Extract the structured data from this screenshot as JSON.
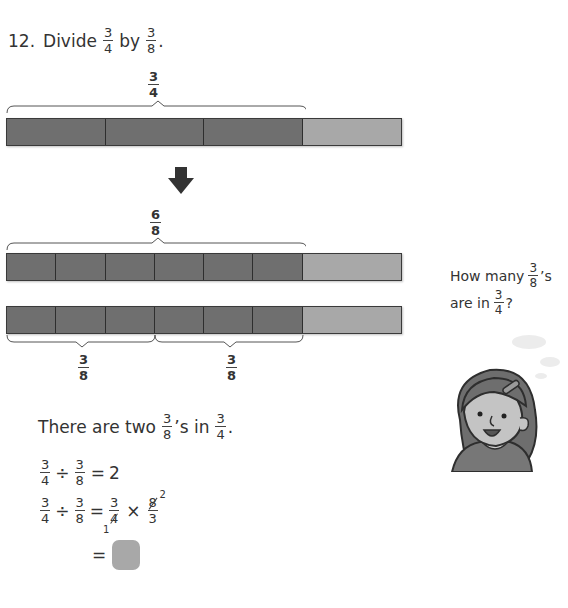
{
  "question": {
    "number": "12.",
    "verb": "Divide",
    "dividend": {
      "n": "3",
      "d": "4"
    },
    "joiner": "by",
    "divisor": {
      "n": "3",
      "d": "8"
    },
    "end": "."
  },
  "diagram": {
    "top_label": {
      "n": "3",
      "d": "4"
    },
    "middle_label": {
      "n": "6",
      "d": "8"
    },
    "bottom_labels": [
      {
        "n": "3",
        "d": "8"
      },
      {
        "n": "3",
        "d": "8"
      }
    ],
    "bar1_parts": 4,
    "bar1_shaded": 3,
    "bar2_parts": 8,
    "bar2_shaded": 6,
    "arrow": "down-arrow",
    "colors": {
      "shaded": "#6f6f6f",
      "unshaded": "#a8a8a8",
      "border": "#3a3a3a"
    }
  },
  "speech": {
    "line1_prefix": "How many",
    "line1_frac": {
      "n": "3",
      "d": "8"
    },
    "line1_suffix": "’s",
    "line2_prefix": "are in",
    "line2_frac": {
      "n": "3",
      "d": "4"
    },
    "line2_suffix": "?"
  },
  "solution": {
    "statement_prefix": "There are two",
    "statement_frac1": {
      "n": "3",
      "d": "8"
    },
    "statement_mid": "’s in",
    "statement_frac2": {
      "n": "3",
      "d": "4"
    },
    "statement_end": ".",
    "eq1": {
      "a": {
        "n": "3",
        "d": "4"
      },
      "op": "÷",
      "b": {
        "n": "3",
        "d": "8"
      },
      "equals": "=",
      "result": "2"
    },
    "eq2": {
      "a": {
        "n": "3",
        "d": "4"
      },
      "op": "÷",
      "b": {
        "n": "3",
        "d": "8"
      },
      "equals": "=",
      "c": {
        "n": "3",
        "d": "4",
        "d_reduced": "1"
      },
      "times": "×",
      "e": {
        "n": "8",
        "n_reduced": "2",
        "d": "3"
      }
    },
    "eq3": {
      "equals": "=",
      "answer_box": ""
    }
  }
}
